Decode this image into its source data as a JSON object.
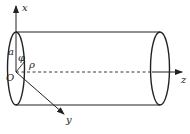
{
  "diagram": {
    "title": "",
    "type": "cylindrical coordinate system on a cylinder",
    "labels": {
      "x_axis": "x",
      "y_axis": "y",
      "z_axis": "z",
      "origin": "O",
      "radius": "a",
      "angle": "φ",
      "rho": "ρ"
    },
    "colors": {
      "stroke": "#222222",
      "background": "#ffffff"
    }
  }
}
